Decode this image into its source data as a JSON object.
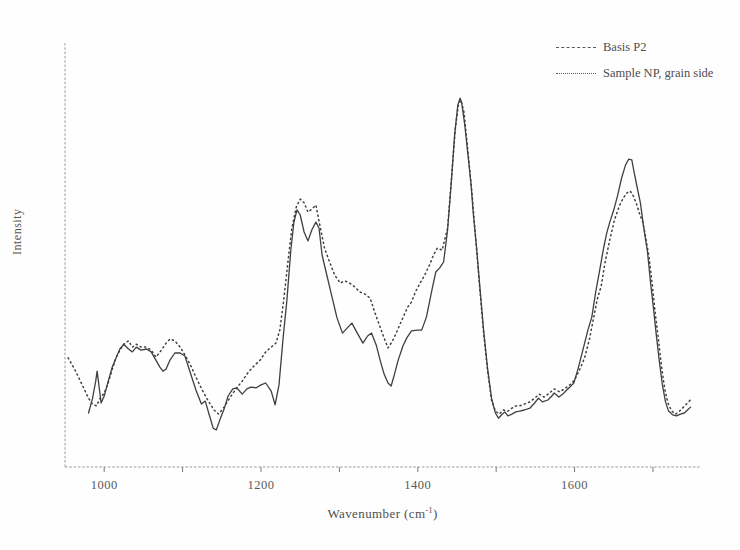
{
  "figure_background": "#fefefe",
  "line_color": "#3f3f3f",
  "axis_color": "#9a9a9a",
  "tick_color": "#7a7a7a",
  "chart_data": {
    "type": "line",
    "title": "",
    "xlabel_main": "Wavenumber (cm",
    "xlabel_sup": "-1",
    "xlabel_close": ")",
    "ylabel": "Intensity",
    "xlim": [
      950,
      1760
    ],
    "ylim": [
      0,
      105
    ],
    "grid": false,
    "legend_position": "top-right",
    "x_axis": {
      "ticks": [
        {
          "value": 1000,
          "label": "1000"
        },
        {
          "value": 1100,
          "label": ""
        },
        {
          "value": 1200,
          "label": "1200"
        },
        {
          "value": 1300,
          "label": ""
        },
        {
          "value": 1400,
          "label": "1400"
        },
        {
          "value": 1500,
          "label": ""
        },
        {
          "value": 1600,
          "label": "1600"
        },
        {
          "value": 1700,
          "label": ""
        }
      ]
    },
    "series": [
      {
        "name": "Basis P2",
        "style": "dashed-fine",
        "points": [
          [
            980,
            14.6
          ],
          [
            985,
            18.4
          ],
          [
            989,
            23.0
          ],
          [
            991,
            25.9
          ],
          [
            994,
            20.8
          ],
          [
            996,
            17.3
          ],
          [
            1000,
            19.2
          ],
          [
            1005,
            23.0
          ],
          [
            1010,
            26.8
          ],
          [
            1015,
            29.5
          ],
          [
            1020,
            31.9
          ],
          [
            1025,
            33.2
          ],
          [
            1031,
            31.9
          ],
          [
            1036,
            31.1
          ],
          [
            1041,
            32.4
          ],
          [
            1047,
            31.6
          ],
          [
            1054,
            31.9
          ],
          [
            1060,
            31.1
          ],
          [
            1066,
            28.9
          ],
          [
            1071,
            27.0
          ],
          [
            1075,
            25.9
          ],
          [
            1079,
            26.5
          ],
          [
            1084,
            28.9
          ],
          [
            1090,
            30.8
          ],
          [
            1097,
            30.8
          ],
          [
            1103,
            30.0
          ],
          [
            1110,
            25.4
          ],
          [
            1117,
            20.8
          ],
          [
            1124,
            17.0
          ],
          [
            1129,
            17.8
          ],
          [
            1134,
            14.1
          ],
          [
            1139,
            10.5
          ],
          [
            1143,
            10.0
          ],
          [
            1148,
            13.0
          ],
          [
            1153,
            15.7
          ],
          [
            1158,
            19.2
          ],
          [
            1164,
            21.1
          ],
          [
            1169,
            21.4
          ],
          [
            1176,
            19.7
          ],
          [
            1182,
            21.1
          ],
          [
            1187,
            21.6
          ],
          [
            1194,
            21.4
          ],
          [
            1200,
            22.2
          ],
          [
            1206,
            22.7
          ],
          [
            1213,
            20.5
          ],
          [
            1218,
            16.8
          ],
          [
            1223,
            22.2
          ],
          [
            1228,
            34.3
          ],
          [
            1233,
            45.1
          ],
          [
            1238,
            58.6
          ],
          [
            1242,
            66.2
          ],
          [
            1246,
            69.5
          ],
          [
            1250,
            68.1
          ],
          [
            1255,
            63.5
          ],
          [
            1260,
            61.1
          ],
          [
            1265,
            64.1
          ],
          [
            1270,
            66.2
          ],
          [
            1274,
            64.6
          ],
          [
            1278,
            57.3
          ],
          [
            1284,
            51.9
          ],
          [
            1290,
            46.5
          ],
          [
            1297,
            40.3
          ],
          [
            1304,
            36.2
          ],
          [
            1311,
            37.8
          ],
          [
            1316,
            38.9
          ],
          [
            1322,
            36.5
          ],
          [
            1330,
            33.5
          ],
          [
            1336,
            35.4
          ],
          [
            1341,
            36.2
          ],
          [
            1347,
            33.0
          ],
          [
            1352,
            28.9
          ],
          [
            1357,
            25.1
          ],
          [
            1362,
            22.7
          ],
          [
            1366,
            21.9
          ],
          [
            1369,
            24.1
          ],
          [
            1375,
            28.9
          ],
          [
            1381,
            32.7
          ],
          [
            1386,
            34.9
          ],
          [
            1392,
            36.8
          ],
          [
            1399,
            37.0
          ],
          [
            1405,
            37.0
          ],
          [
            1411,
            40.5
          ],
          [
            1418,
            47.8
          ],
          [
            1423,
            52.7
          ],
          [
            1428,
            53.8
          ],
          [
            1433,
            55.4
          ],
          [
            1438,
            64.1
          ],
          [
            1443,
            77.6
          ],
          [
            1447,
            89.7
          ],
          [
            1451,
            97.8
          ],
          [
            1454,
            99.7
          ],
          [
            1456,
            98.4
          ],
          [
            1460,
            92.4
          ],
          [
            1464,
            84.3
          ],
          [
            1468,
            76.2
          ],
          [
            1471,
            68.1
          ],
          [
            1475,
            59.2
          ],
          [
            1479,
            49.2
          ],
          [
            1484,
            37.0
          ],
          [
            1489,
            26.8
          ],
          [
            1494,
            18.6
          ],
          [
            1499,
            14.6
          ],
          [
            1503,
            13.2
          ],
          [
            1507,
            14.1
          ],
          [
            1511,
            14.9
          ],
          [
            1515,
            13.8
          ],
          [
            1520,
            14.3
          ],
          [
            1525,
            14.9
          ],
          [
            1530,
            15.1
          ],
          [
            1536,
            15.4
          ],
          [
            1543,
            15.9
          ],
          [
            1549,
            17.3
          ],
          [
            1554,
            18.6
          ],
          [
            1559,
            17.6
          ],
          [
            1566,
            18.1
          ],
          [
            1571,
            19.2
          ],
          [
            1574,
            20.0
          ],
          [
            1580,
            18.9
          ],
          [
            1585,
            19.7
          ],
          [
            1590,
            20.8
          ],
          [
            1594,
            21.6
          ],
          [
            1599,
            22.7
          ],
          [
            1604,
            26.2
          ],
          [
            1610,
            31.1
          ],
          [
            1617,
            37.0
          ],
          [
            1622,
            40.5
          ],
          [
            1627,
            47.3
          ],
          [
            1632,
            53.2
          ],
          [
            1637,
            59.2
          ],
          [
            1641,
            63.2
          ],
          [
            1645,
            66.2
          ],
          [
            1650,
            69.5
          ],
          [
            1655,
            73.5
          ],
          [
            1660,
            78.1
          ],
          [
            1665,
            81.6
          ],
          [
            1669,
            83.2
          ],
          [
            1673,
            83.0
          ],
          [
            1676,
            79.7
          ],
          [
            1680,
            75.4
          ],
          [
            1684,
            71.4
          ],
          [
            1688,
            64.9
          ],
          [
            1693,
            58.1
          ],
          [
            1697,
            49.7
          ],
          [
            1701,
            42.4
          ],
          [
            1704,
            36.2
          ],
          [
            1708,
            28.9
          ],
          [
            1712,
            22.2
          ],
          [
            1716,
            17.6
          ],
          [
            1720,
            15.1
          ],
          [
            1725,
            14.1
          ],
          [
            1730,
            13.8
          ],
          [
            1735,
            14.3
          ],
          [
            1740,
            14.6
          ],
          [
            1744,
            15.4
          ],
          [
            1748,
            16.2
          ]
        ]
      },
      {
        "name": "Sample NP, grain side",
        "style": "dotted",
        "points": [
          [
            954,
            29.5
          ],
          [
            959,
            27.6
          ],
          [
            964,
            25.7
          ],
          [
            969,
            23.5
          ],
          [
            975,
            20.8
          ],
          [
            980,
            18.6
          ],
          [
            985,
            17.0
          ],
          [
            990,
            16.5
          ],
          [
            995,
            18.6
          ],
          [
            1000,
            20.0
          ],
          [
            1005,
            22.7
          ],
          [
            1010,
            26.2
          ],
          [
            1015,
            29.5
          ],
          [
            1020,
            31.6
          ],
          [
            1025,
            33.2
          ],
          [
            1031,
            34.1
          ],
          [
            1036,
            32.4
          ],
          [
            1041,
            33.2
          ],
          [
            1047,
            32.4
          ],
          [
            1054,
            32.4
          ],
          [
            1060,
            31.6
          ],
          [
            1066,
            29.7
          ],
          [
            1073,
            31.6
          ],
          [
            1079,
            33.5
          ],
          [
            1084,
            34.6
          ],
          [
            1090,
            34.1
          ],
          [
            1097,
            32.4
          ],
          [
            1103,
            30.3
          ],
          [
            1110,
            27.6
          ],
          [
            1117,
            24.3
          ],
          [
            1125,
            20.8
          ],
          [
            1132,
            18.1
          ],
          [
            1140,
            15.4
          ],
          [
            1146,
            14.3
          ],
          [
            1153,
            16.2
          ],
          [
            1160,
            18.6
          ],
          [
            1168,
            21.1
          ],
          [
            1176,
            23.2
          ],
          [
            1183,
            25.4
          ],
          [
            1191,
            27.3
          ],
          [
            1199,
            28.9
          ],
          [
            1206,
            31.1
          ],
          [
            1213,
            32.4
          ],
          [
            1219,
            33.5
          ],
          [
            1224,
            37.0
          ],
          [
            1229,
            45.1
          ],
          [
            1234,
            54.6
          ],
          [
            1239,
            64.1
          ],
          [
            1245,
            70.3
          ],
          [
            1250,
            72.4
          ],
          [
            1255,
            71.4
          ],
          [
            1260,
            68.9
          ],
          [
            1265,
            69.7
          ],
          [
            1270,
            70.8
          ],
          [
            1275,
            65.4
          ],
          [
            1281,
            59.2
          ],
          [
            1288,
            55.1
          ],
          [
            1294,
            51.9
          ],
          [
            1301,
            49.7
          ],
          [
            1307,
            50.3
          ],
          [
            1313,
            49.7
          ],
          [
            1320,
            48.6
          ],
          [
            1326,
            47.3
          ],
          [
            1332,
            46.8
          ],
          [
            1339,
            45.7
          ],
          [
            1345,
            41.9
          ],
          [
            1352,
            37.8
          ],
          [
            1357,
            34.9
          ],
          [
            1362,
            32.2
          ],
          [
            1367,
            33.8
          ],
          [
            1372,
            35.9
          ],
          [
            1377,
            38.4
          ],
          [
            1382,
            40.8
          ],
          [
            1387,
            43.2
          ],
          [
            1392,
            44.6
          ],
          [
            1397,
            47.3
          ],
          [
            1403,
            49.7
          ],
          [
            1409,
            51.9
          ],
          [
            1415,
            54.6
          ],
          [
            1420,
            57.3
          ],
          [
            1425,
            59.2
          ],
          [
            1431,
            58.6
          ],
          [
            1438,
            64.6
          ],
          [
            1443,
            78.1
          ],
          [
            1448,
            91.6
          ],
          [
            1452,
            98.1
          ],
          [
            1455,
            99.2
          ],
          [
            1459,
            95.9
          ],
          [
            1464,
            85.1
          ],
          [
            1469,
            74.3
          ],
          [
            1474,
            61.4
          ],
          [
            1479,
            48.4
          ],
          [
            1484,
            36.2
          ],
          [
            1489,
            26.2
          ],
          [
            1494,
            18.1
          ],
          [
            1499,
            15.1
          ],
          [
            1504,
            14.3
          ],
          [
            1509,
            15.4
          ],
          [
            1515,
            15.1
          ],
          [
            1520,
            15.9
          ],
          [
            1525,
            16.5
          ],
          [
            1530,
            16.5
          ],
          [
            1536,
            17.0
          ],
          [
            1543,
            17.6
          ],
          [
            1549,
            18.6
          ],
          [
            1555,
            19.7
          ],
          [
            1561,
            18.9
          ],
          [
            1568,
            20.0
          ],
          [
            1574,
            21.1
          ],
          [
            1581,
            20.3
          ],
          [
            1587,
            21.1
          ],
          [
            1592,
            21.9
          ],
          [
            1597,
            22.7
          ],
          [
            1602,
            24.3
          ],
          [
            1608,
            27.0
          ],
          [
            1613,
            29.7
          ],
          [
            1619,
            34.6
          ],
          [
            1624,
            40.0
          ],
          [
            1629,
            45.4
          ],
          [
            1634,
            48.9
          ],
          [
            1639,
            55.4
          ],
          [
            1645,
            61.4
          ],
          [
            1651,
            66.8
          ],
          [
            1657,
            70.5
          ],
          [
            1662,
            72.7
          ],
          [
            1667,
            74.1
          ],
          [
            1671,
            74.6
          ],
          [
            1675,
            73.2
          ],
          [
            1679,
            71.1
          ],
          [
            1683,
            68.4
          ],
          [
            1687,
            66.2
          ],
          [
            1690,
            63.0
          ],
          [
            1695,
            56.8
          ],
          [
            1699,
            49.5
          ],
          [
            1703,
            41.4
          ],
          [
            1707,
            34.3
          ],
          [
            1711,
            27.0
          ],
          [
            1715,
            21.1
          ],
          [
            1719,
            17.3
          ],
          [
            1724,
            15.1
          ],
          [
            1729,
            14.3
          ],
          [
            1734,
            15.1
          ],
          [
            1739,
            16.2
          ],
          [
            1744,
            17.3
          ],
          [
            1749,
            18.4
          ]
        ]
      }
    ]
  }
}
